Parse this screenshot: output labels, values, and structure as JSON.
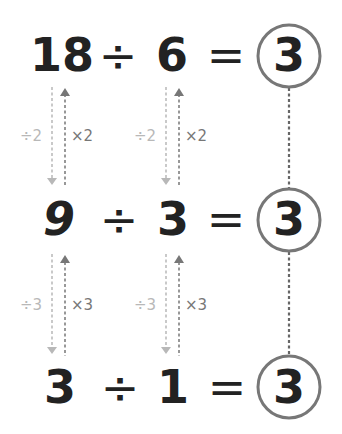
{
  "colors": {
    "digits": "#222222",
    "circle": "#777777",
    "down_arrow": "#b8b8b8",
    "up_arrow": "#777777",
    "connector": "#666666"
  },
  "equations": [
    {
      "dividend": "18",
      "operator": "÷",
      "divisor": "6",
      "equals": "=",
      "quotient": "3"
    },
    {
      "dividend": "9",
      "operator": "÷",
      "divisor": "3",
      "equals": "=",
      "quotient": "3"
    },
    {
      "dividend": "3",
      "operator": "÷",
      "divisor": "1",
      "equals": "=",
      "quotient": "3"
    }
  ],
  "transforms": [
    {
      "between_rows": "1-2",
      "dividend": {
        "down": "÷2",
        "up": "×2"
      },
      "divisor": {
        "down": "÷2",
        "up": "×2"
      }
    },
    {
      "between_rows": "2-3",
      "dividend": {
        "down": "÷3",
        "up": "×3"
      },
      "divisor": {
        "down": "÷3",
        "up": "×3"
      }
    }
  ],
  "icons": {
    "down_arrow": "dashed-down-arrow",
    "up_arrow": "dashed-up-arrow",
    "quotient_circle": "circle-outline",
    "connector": "dotted-vertical-line"
  }
}
